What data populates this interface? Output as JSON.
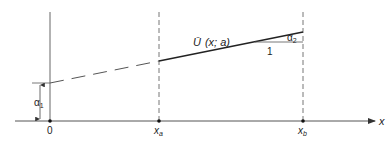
{
  "diagram": {
    "function_label": "Ũ (x; a)",
    "function_label_parts": {
      "symbol": "Ū",
      "args": "(x; a)"
    },
    "axis_x_label": "x",
    "origin_label": "0",
    "xa_label": {
      "base": "x",
      "sub": "a"
    },
    "xb_label": {
      "base": "x",
      "sub": "b"
    },
    "alpha1_label": {
      "base": "α",
      "sub": "1"
    },
    "alpha2_label": {
      "base": "α",
      "sub": "2"
    },
    "slope_run_label": "1"
  },
  "colors": {
    "line": "#222222",
    "axis": "#555555",
    "dashed": "#777777"
  }
}
